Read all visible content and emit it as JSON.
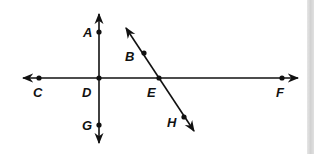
{
  "diagram": {
    "type": "geometry-lines",
    "stroke_color": "#111111",
    "background": "#ffffff",
    "lines": [
      {
        "name": "line-CF",
        "from": [
          23,
          78
        ],
        "to": [
          298,
          78
        ],
        "arrows": "both"
      },
      {
        "name": "line-AG",
        "from": [
          99,
          14
        ],
        "to": [
          99,
          143
        ],
        "arrows": "both"
      },
      {
        "name": "line-BH",
        "from": [
          126,
          28
        ],
        "to": [
          194,
          131
        ],
        "arrows": "both"
      }
    ],
    "points": [
      {
        "label": "A",
        "x": 99,
        "y": 32,
        "lx": 83,
        "ly": 37
      },
      {
        "label": "B",
        "x": 144,
        "y": 53,
        "lx": 125,
        "ly": 61
      },
      {
        "label": "C",
        "x": 39,
        "y": 78,
        "lx": 33,
        "ly": 97
      },
      {
        "label": "D",
        "x": 99,
        "y": 78,
        "lx": 82,
        "ly": 97
      },
      {
        "label": "E",
        "x": 159,
        "y": 78,
        "lx": 147,
        "ly": 97
      },
      {
        "label": "F",
        "x": 282,
        "y": 78,
        "lx": 276,
        "ly": 97
      },
      {
        "label": "G",
        "x": 99,
        "y": 125,
        "lx": 82,
        "ly": 130
      },
      {
        "label": "H",
        "x": 184,
        "y": 117,
        "lx": 167,
        "ly": 127
      }
    ]
  }
}
